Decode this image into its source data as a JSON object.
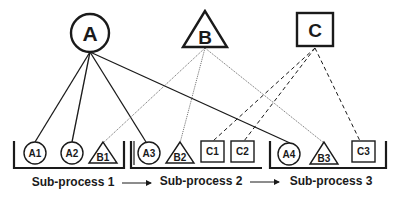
{
  "diagram": {
    "top_nodes": [
      {
        "id": "A",
        "label": "A",
        "shape": "circle"
      },
      {
        "id": "B",
        "label": "B",
        "shape": "triangle"
      },
      {
        "id": "C",
        "label": "C",
        "shape": "square"
      }
    ],
    "subprocesses": [
      {
        "label": "Sub-process 1",
        "nodes": [
          {
            "label": "A1",
            "shape": "circle"
          },
          {
            "label": "A2",
            "shape": "circle"
          },
          {
            "label": "B1",
            "shape": "triangle"
          }
        ]
      },
      {
        "label": "Sub-process 2",
        "nodes": [
          {
            "label": "A3",
            "shape": "circle"
          },
          {
            "label": "B2",
            "shape": "triangle"
          },
          {
            "label": "C1",
            "shape": "square"
          },
          {
            "label": "C2",
            "shape": "square"
          }
        ]
      },
      {
        "label": "Sub-process 3",
        "nodes": [
          {
            "label": "A4",
            "shape": "circle"
          },
          {
            "label": "B3",
            "shape": "triangle"
          },
          {
            "label": "C3",
            "shape": "square"
          }
        ]
      }
    ],
    "edges": [
      {
        "from": "A",
        "to": "A1",
        "style": "solid"
      },
      {
        "from": "A",
        "to": "A2",
        "style": "solid"
      },
      {
        "from": "A",
        "to": "A3",
        "style": "solid"
      },
      {
        "from": "A",
        "to": "A4",
        "style": "solid"
      },
      {
        "from": "B",
        "to": "B1",
        "style": "dotted"
      },
      {
        "from": "B",
        "to": "B2",
        "style": "dotted"
      },
      {
        "from": "B",
        "to": "B3",
        "style": "dotted"
      },
      {
        "from": "C",
        "to": "C1",
        "style": "dashed"
      },
      {
        "from": "C",
        "to": "C2",
        "style": "dashed"
      },
      {
        "from": "C",
        "to": "C3",
        "style": "dashed"
      }
    ],
    "flow_arrows": [
      {
        "from": "Sub-process 1",
        "to": "Sub-process 2"
      },
      {
        "from": "Sub-process 2",
        "to": "Sub-process 3"
      }
    ],
    "colors": {
      "stroke": "#1a1a1a",
      "background": "#ffffff"
    }
  }
}
